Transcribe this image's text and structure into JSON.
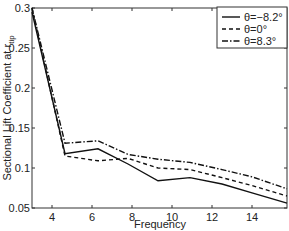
{
  "chart_data": {
    "type": "line",
    "title": "",
    "xlabel": "Frequency",
    "ylabel": "Sectional Lift Coefficient at r",
    "ylabel_subscript": "tip",
    "xlim": [
      3,
      15.75
    ],
    "ylim": [
      0.05,
      0.3
    ],
    "xticks": [
      4,
      6,
      8,
      10,
      12,
      14
    ],
    "xtick_labels": [
      "4",
      "6",
      "8",
      "10",
      "12",
      "14"
    ],
    "yticks": [
      0.05,
      0.1,
      0.15,
      0.2,
      0.25,
      0.3
    ],
    "ytick_labels": [
      "0.05",
      "0.1",
      "0.15",
      "0.2",
      "0.25",
      "0.3"
    ],
    "grid": false,
    "legend_position": "upper right",
    "series": [
      {
        "name": "θ=−8.2°",
        "style": "solid",
        "x": [
          3.0,
          4.65,
          6.3,
          7.8,
          9.3,
          10.9,
          12.5,
          14.0,
          15.75
        ],
        "y": [
          0.295,
          0.118,
          0.124,
          0.105,
          0.084,
          0.088,
          0.08,
          0.069,
          0.056
        ]
      },
      {
        "name": "θ=0°",
        "style": "dashed",
        "x": [
          3.0,
          4.65,
          6.3,
          7.8,
          9.3,
          10.9,
          12.5,
          14.0,
          15.75
        ],
        "y": [
          0.3,
          0.115,
          0.109,
          0.112,
          0.1,
          0.098,
          0.088,
          0.078,
          0.065
        ]
      },
      {
        "name": "θ=8.3°",
        "style": "dashdot",
        "x": [
          3.0,
          4.65,
          6.3,
          7.8,
          9.3,
          10.9,
          12.5,
          14.0,
          15.75
        ],
        "y": [
          0.3,
          0.131,
          0.134,
          0.117,
          0.111,
          0.107,
          0.098,
          0.089,
          0.074
        ]
      }
    ]
  }
}
